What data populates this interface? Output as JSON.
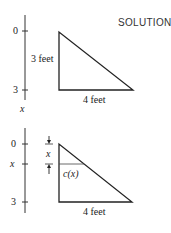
{
  "title": "SOLUTION",
  "top_figure": {
    "axis_ticks": [
      "0",
      "3"
    ],
    "axis_variable": "x",
    "height_label": "3 feet",
    "base_label": "4 feet"
  },
  "bottom_figure": {
    "axis_ticks": [
      "0",
      "x",
      "3"
    ],
    "depth_label": "x",
    "width_label": "c(x)",
    "base_label": "4 feet"
  }
}
